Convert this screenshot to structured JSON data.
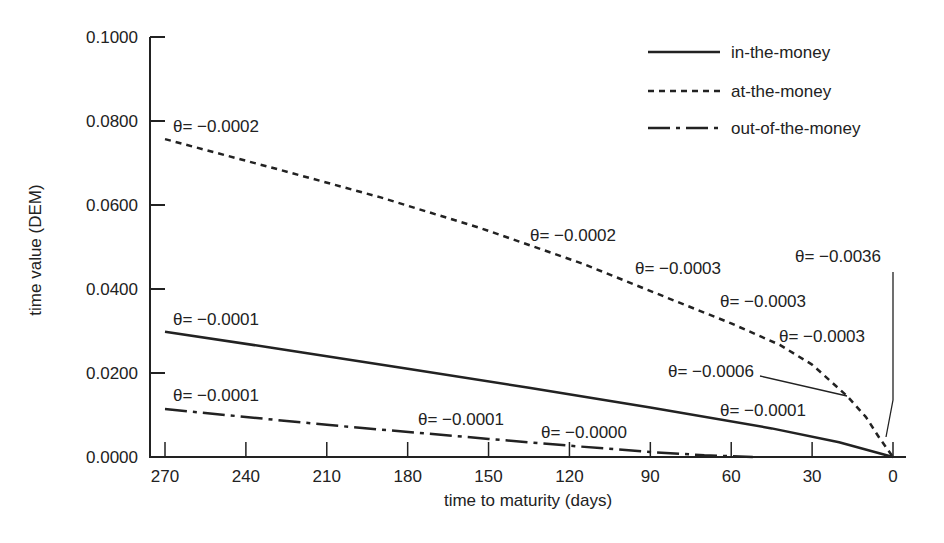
{
  "chart_data": {
    "type": "line",
    "title": "",
    "xlabel": "time to maturity (days)",
    "ylabel": "time value (DEM)",
    "xlim": [
      270,
      0
    ],
    "ylim": [
      0,
      0.1
    ],
    "x_reversed": true,
    "grid": false,
    "legend_position": "upper right",
    "x_ticks": [
      270,
      240,
      210,
      180,
      150,
      120,
      90,
      60,
      30,
      0
    ],
    "x_tick_labels": [
      "270",
      "240",
      "210",
      "180",
      "150",
      "120",
      "90",
      "60",
      "30",
      "0"
    ],
    "y_ticks": [
      0,
      0.02,
      0.04,
      0.06,
      0.08,
      0.1
    ],
    "y_tick_labels": [
      "0.0000",
      "0.0200",
      "0.0400",
      "0.0600",
      "0.0800",
      "0.1000"
    ],
    "series": [
      {
        "name": "in-the-money",
        "style": "solid",
        "x": [
          270,
          225,
          180,
          135,
          90,
          45,
          20,
          0
        ],
        "values": [
          0.0298,
          0.0255,
          0.021,
          0.0165,
          0.0118,
          0.0068,
          0.0035,
          0.0
        ]
      },
      {
        "name": "at-the-money",
        "style": "dashed",
        "x": [
          270,
          227,
          190,
          153,
          115,
          79,
          60,
          42,
          30,
          17,
          10,
          5,
          0
        ],
        "values": [
          0.0757,
          0.0683,
          0.0618,
          0.0545,
          0.046,
          0.0367,
          0.0318,
          0.0267,
          0.022,
          0.0145,
          0.0095,
          0.0045,
          0.0
        ]
      },
      {
        "name": "out-of-the-money",
        "style": "dash-dot",
        "x": [
          270,
          209,
          150,
          120,
          90,
          70,
          52
        ],
        "values": [
          0.0114,
          0.0076,
          0.0043,
          0.0027,
          0.0012,
          0.0004,
          0.0
        ]
      }
    ],
    "annotations": [
      {
        "text": "θ= −0.0002",
        "series": "at-the-money",
        "x_px": 173,
        "y_px": 132
      },
      {
        "text": "θ= −0.0002",
        "series": "at-the-money",
        "x_px": 530,
        "y_px": 241
      },
      {
        "text": "θ= −0.0003",
        "series": "at-the-money",
        "x_px": 635,
        "y_px": 274
      },
      {
        "text": "θ= −0.0003",
        "series": "at-the-money",
        "x_px": 720,
        "y_px": 307
      },
      {
        "text": "θ= −0.0003",
        "series": "at-the-money",
        "x_px": 779,
        "y_px": 342
      },
      {
        "text": "θ= −0.0006",
        "series": "at-the-money",
        "x_px": 668,
        "y_px": 377
      },
      {
        "text": "θ= −0.0036",
        "series": "at-the-money",
        "x_px": 795,
        "y_px": 262
      },
      {
        "text": "θ= −0.0001",
        "series": "in-the-money",
        "x_px": 173,
        "y_px": 325
      },
      {
        "text": "θ= −0.0001",
        "series": "in-the-money",
        "x_px": 720,
        "y_px": 416
      },
      {
        "text": "θ= −0.0001",
        "series": "out-of-the-money",
        "x_px": 173,
        "y_px": 401
      },
      {
        "text": "θ= −0.0001",
        "series": "out-of-the-money",
        "x_px": 418,
        "y_px": 425
      },
      {
        "text": "θ= −0.0000",
        "series": "out-of-the-money",
        "x_px": 541,
        "y_px": 438
      }
    ],
    "leader_lines": [
      {
        "for": "θ= −0.0006",
        "points": [
          [
            760,
            376
          ],
          [
            847,
            396
          ]
        ]
      },
      {
        "for": "θ= −0.0036",
        "points": [
          [
            893,
            272
          ],
          [
            893,
            400
          ],
          [
            886,
            437
          ]
        ]
      }
    ]
  },
  "legend": {
    "items": [
      {
        "label": "in-the-money",
        "style": "solid"
      },
      {
        "label": "at-the-money",
        "style": "dashed"
      },
      {
        "label": "out-of-the-money",
        "style": "dash-dot"
      }
    ]
  },
  "colors": {
    "ink": "#222222",
    "background": "#ffffff"
  }
}
